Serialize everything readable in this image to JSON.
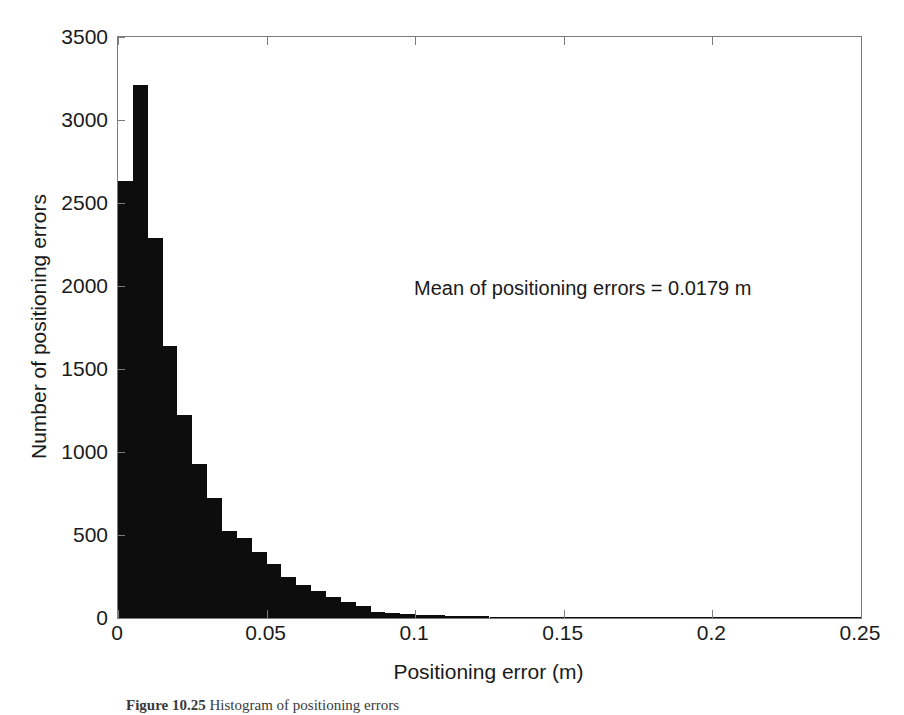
{
  "figure": {
    "caption_label": "Figure 10.25",
    "caption_text": "Histogram of positioning errors"
  },
  "annotation": {
    "mean_text": "Mean of positioning errors = 0.0179 m"
  },
  "axes": {
    "x_title": "Positioning error (m)",
    "y_title": "Number of positioning errors",
    "x_ticks": [
      "0",
      "0.05",
      "0.1",
      "0.15",
      "0.2",
      "0.25"
    ],
    "y_ticks": [
      "0",
      "500",
      "1000",
      "1500",
      "2000",
      "2500",
      "3000",
      "3500"
    ]
  },
  "colors": {
    "bar": "#0d0d0d",
    "axis": "#7d7d7d",
    "text": "#1a1a1a",
    "background": "#ffffff"
  },
  "chart_data": {
    "type": "bar",
    "title": "",
    "subtitle": "",
    "xlabel": "Positioning error (m)",
    "ylabel": "Number of positioning errors",
    "xlim": [
      0,
      0.25
    ],
    "ylim": [
      0,
      3500
    ],
    "xticks": [
      0,
      0.05,
      0.1,
      0.15,
      0.2,
      0.25
    ],
    "yticks": [
      0,
      500,
      1000,
      1500,
      2000,
      2500,
      3000,
      3500
    ],
    "grid": false,
    "legend": null,
    "bin_width": 0.005,
    "annotations": [
      {
        "text": "Mean of positioning errors = 0.0179 m",
        "x": 0.1,
        "y": 2050
      }
    ],
    "categories": [
      "0.000-0.005",
      "0.005-0.010",
      "0.010-0.015",
      "0.015-0.020",
      "0.020-0.025",
      "0.025-0.030",
      "0.030-0.035",
      "0.035-0.040",
      "0.040-0.045",
      "0.045-0.050",
      "0.050-0.055",
      "0.055-0.060",
      "0.060-0.065",
      "0.065-0.070",
      "0.070-0.075",
      "0.075-0.080",
      "0.080-0.085",
      "0.085-0.090",
      "0.090-0.095",
      "0.095-0.100",
      "0.100-0.105",
      "0.105-0.110",
      "0.110-0.115",
      "0.115-0.120",
      "0.120-0.125",
      "0.125-0.130",
      "0.130-0.135",
      "0.135-0.140",
      "0.140-0.145",
      "0.145-0.150",
      "0.150-0.155",
      "0.155-0.160",
      "0.160-0.165",
      "0.165-0.170",
      "0.170-0.175",
      "0.175-0.180",
      "0.180-0.185",
      "0.185-0.190",
      "0.190-0.195",
      "0.195-0.200",
      "0.200-0.205",
      "0.205-0.210",
      "0.210-0.215",
      "0.215-0.220",
      "0.220-0.225",
      "0.225-0.230",
      "0.230-0.235",
      "0.235-0.240",
      "0.240-0.245",
      "0.245-0.250"
    ],
    "x": [
      0.0025,
      0.0075,
      0.0125,
      0.0175,
      0.0225,
      0.0275,
      0.0325,
      0.0375,
      0.0425,
      0.0475,
      0.0525,
      0.0575,
      0.0625,
      0.0675,
      0.0725,
      0.0775,
      0.0825,
      0.0875,
      0.0925,
      0.0975,
      0.1025,
      0.1075,
      0.1125,
      0.1175,
      0.1225,
      0.1275,
      0.1325,
      0.1375,
      0.1425,
      0.1475,
      0.1525,
      0.1575,
      0.1625,
      0.1675,
      0.1725,
      0.1775,
      0.1825,
      0.1875,
      0.1925,
      0.1975,
      0.2025,
      0.2075,
      0.2125,
      0.2175,
      0.2225,
      0.2275,
      0.2325,
      0.2375,
      0.2425,
      0.2475
    ],
    "values": [
      2630,
      3210,
      2290,
      1640,
      1220,
      930,
      720,
      525,
      480,
      395,
      325,
      245,
      200,
      160,
      125,
      95,
      70,
      34,
      28,
      22,
      20,
      16,
      14,
      12,
      10,
      9,
      8,
      7,
      6,
      6,
      5,
      4,
      4,
      8,
      3,
      3,
      2,
      7,
      2,
      2,
      1,
      1,
      1,
      1,
      1,
      1,
      6,
      1,
      1,
      1
    ]
  }
}
